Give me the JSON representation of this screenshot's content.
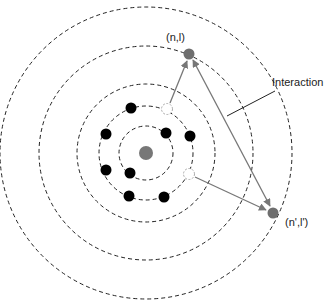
{
  "diagram": {
    "labels": {
      "upper_state": "(n,l)",
      "lower_state": "(n',l')",
      "interaction": "Interaction"
    },
    "orbits_count": 5,
    "electrons_count": 8,
    "holes_count": 2,
    "colors": {
      "nucleus": "#777777",
      "electron": "#000000",
      "excited_electron": "#6e6e6e",
      "orbit": "#222222",
      "arrow": "#777777",
      "pointer": "#222222",
      "hole_stroke": "#aaaaaa"
    }
  }
}
